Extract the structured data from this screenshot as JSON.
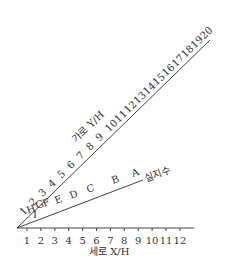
{
  "chart_data": {
    "type": "nomogram",
    "title": "",
    "xlabel": "세로 X/H",
    "upper_scale_label": "가로 Y/H",
    "lower_scale_label": "실지수",
    "x_ticks": [
      1,
      2,
      3,
      4,
      5,
      6,
      7,
      8,
      9,
      10,
      11,
      12
    ],
    "upper_ticks": [
      1,
      2,
      3,
      4,
      5,
      6,
      7,
      8,
      9,
      10,
      11,
      12,
      13,
      14,
      15,
      16,
      17,
      18,
      19,
      20
    ],
    "lower_letters": [
      "I",
      "H",
      "G",
      "F",
      "E",
      "D",
      "C",
      "B",
      "A"
    ]
  },
  "labels": {
    "xlabel": "세로 X/H",
    "upper": "가로 Y/H",
    "lower": "실지수"
  }
}
